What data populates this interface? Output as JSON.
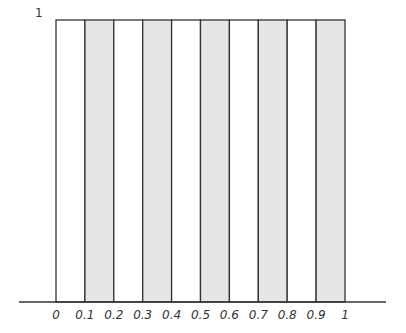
{
  "chart_data": {
    "type": "bar",
    "title": "",
    "xlabel": "",
    "ylabel": "",
    "ylim": [
      0,
      1
    ],
    "xlim": [
      0,
      1
    ],
    "y_tick_labels": [
      "1"
    ],
    "x_tick_labels": [
      "0",
      "0.1",
      "0.2",
      "0.3",
      "0.4",
      "0.5",
      "0.6",
      "0.7",
      "0.8",
      "0.9",
      "1"
    ],
    "categories": [
      "0-0.1",
      "0.1-0.2",
      "0.2-0.3",
      "0.3-0.4",
      "0.4-0.5",
      "0.5-0.6",
      "0.6-0.7",
      "0.7-0.8",
      "0.8-0.9",
      "0.9-1"
    ],
    "values": [
      1,
      1,
      1,
      1,
      1,
      1,
      1,
      1,
      1,
      1
    ],
    "shaded": [
      false,
      true,
      false,
      true,
      false,
      true,
      false,
      true,
      false,
      true
    ],
    "grid": false,
    "legend": null
  },
  "colors": {
    "shaded_fill": "#e6e6e6",
    "unshaded_fill": "#ffffff",
    "stroke": "#333333"
  },
  "labels": {
    "y_top": "1",
    "x": [
      "0",
      "0.1",
      "0.2",
      "0.3",
      "0.4",
      "0.5",
      "0.6",
      "0.7",
      "0.8",
      "0.9",
      "1"
    ]
  }
}
